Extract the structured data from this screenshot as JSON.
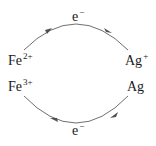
{
  "diagram": {
    "top_arc": {
      "label": "e",
      "charge": "−",
      "direction": "Fe2+ to Ag+"
    },
    "bottom_arc": {
      "label": "e",
      "charge": "−",
      "direction": "Ag to Fe3+"
    },
    "left": {
      "top_species": {
        "symbol": "Fe",
        "charge": "2+"
      },
      "bottom_species": {
        "symbol": "Fe",
        "charge": "3+"
      }
    },
    "right": {
      "top_species": {
        "symbol": "Ag",
        "charge": "+"
      },
      "bottom_species": {
        "symbol": "Ag",
        "charge": ""
      }
    },
    "colors": {
      "arc": "#707070",
      "text": "#1a1a1a"
    }
  }
}
